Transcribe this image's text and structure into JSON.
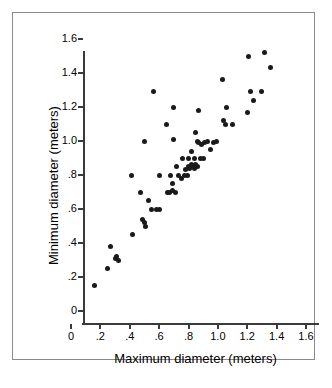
{
  "figure": {
    "x_axis_title": "Maximum diameter (meters)",
    "y_axis_title": "Minimum diameter (meters)",
    "frame_color": "#8a8a8a",
    "axis_color": "#3a3a3a",
    "point_color": "#1a1a1a",
    "background_color": "#ffffff"
  },
  "chart_data": {
    "type": "scatter",
    "title": "",
    "xlabel": "Maximum diameter (meters)",
    "ylabel": "Minimum diameter (meters)",
    "xlim": [
      0,
      1.6
    ],
    "ylim": [
      0,
      1.6
    ],
    "xticks": [
      0,
      0.2,
      0.4,
      0.6,
      0.8,
      1.0,
      1.2,
      1.4,
      1.6
    ],
    "yticks": [
      0,
      0.2,
      0.4,
      0.6,
      0.8,
      1.0,
      1.2,
      1.4,
      1.6
    ],
    "xticklabels": [
      "0",
      ".2",
      ".4",
      ".6",
      ".8",
      "1.0",
      "1.2",
      "1.4",
      "1.6"
    ],
    "yticklabels": [
      "0",
      ".2",
      ".4",
      ".6",
      ".8",
      "1.0",
      "1.2",
      "1.4",
      "1.6"
    ],
    "grid": false,
    "legend": null,
    "marker": "filled-circle",
    "series": [
      {
        "name": "sample",
        "points": [
          [
            0.16,
            0.15
          ],
          [
            0.25,
            0.25
          ],
          [
            0.27,
            0.38
          ],
          [
            0.3,
            0.31
          ],
          [
            0.31,
            0.32
          ],
          [
            0.32,
            0.3
          ],
          [
            0.41,
            0.8
          ],
          [
            0.42,
            0.45
          ],
          [
            0.47,
            0.7
          ],
          [
            0.49,
            0.54
          ],
          [
            0.5,
            0.52
          ],
          [
            0.5,
            1.0
          ],
          [
            0.51,
            0.5
          ],
          [
            0.53,
            0.65
          ],
          [
            0.55,
            0.6
          ],
          [
            0.56,
            1.29
          ],
          [
            0.58,
            0.6
          ],
          [
            0.6,
            0.6
          ],
          [
            0.6,
            0.8
          ],
          [
            0.65,
            1.1
          ],
          [
            0.66,
            0.7
          ],
          [
            0.67,
            0.7
          ],
          [
            0.68,
            0.8
          ],
          [
            0.69,
            0.71
          ],
          [
            0.69,
            0.75
          ],
          [
            0.7,
            1.01
          ],
          [
            0.7,
            1.2
          ],
          [
            0.71,
            0.7
          ],
          [
            0.72,
            0.85
          ],
          [
            0.73,
            0.8
          ],
          [
            0.75,
            0.78
          ],
          [
            0.76,
            0.9
          ],
          [
            0.77,
            0.8
          ],
          [
            0.78,
            0.83
          ],
          [
            0.79,
            0.8
          ],
          [
            0.8,
            0.85
          ],
          [
            0.8,
            0.9
          ],
          [
            0.81,
            0.84
          ],
          [
            0.82,
            0.86
          ],
          [
            0.82,
            0.94
          ],
          [
            0.83,
            0.85
          ],
          [
            0.84,
            0.84
          ],
          [
            0.84,
            0.9
          ],
          [
            0.85,
            0.86
          ],
          [
            0.85,
            1.05
          ],
          [
            0.86,
            0.85
          ],
          [
            0.86,
            1.0
          ],
          [
            0.87,
            0.99
          ],
          [
            0.87,
            1.18
          ],
          [
            0.88,
            0.9
          ],
          [
            0.89,
            0.98
          ],
          [
            0.9,
            0.9
          ],
          [
            0.91,
            0.99
          ],
          [
            0.93,
            1.0
          ],
          [
            0.95,
            0.95
          ],
          [
            0.97,
            0.99
          ],
          [
            0.99,
            1.0
          ],
          [
            1.03,
            1.36
          ],
          [
            1.04,
            1.12
          ],
          [
            1.05,
            1.1
          ],
          [
            1.06,
            1.2
          ],
          [
            1.1,
            1.1
          ],
          [
            1.2,
            1.17
          ],
          [
            1.21,
            1.5
          ],
          [
            1.22,
            1.29
          ],
          [
            1.24,
            1.24
          ],
          [
            1.3,
            1.29
          ],
          [
            1.32,
            1.52
          ],
          [
            1.36,
            1.43
          ]
        ]
      }
    ]
  }
}
